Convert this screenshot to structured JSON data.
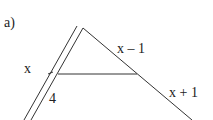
{
  "figure": {
    "part_label": "a)",
    "labels": {
      "left_upper": "x",
      "left_lower": "4",
      "right_upper": "x – 1",
      "right_lower": "x + 1"
    },
    "colors": {
      "line": "#333333",
      "text": "#222222",
      "background": "#ffffff"
    }
  }
}
